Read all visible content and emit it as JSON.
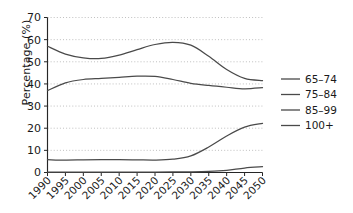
{
  "chart_data": {
    "type": "line",
    "title": "",
    "xlabel": "",
    "ylabel": "Percentage (%)",
    "xlim": [
      1990,
      2050
    ],
    "ylim": [
      0,
      70
    ],
    "yticks": [
      0,
      10,
      20,
      30,
      40,
      50,
      60,
      70
    ],
    "ytick_labels": [
      "0",
      "10",
      "20",
      "30",
      "40",
      "50",
      "60",
      "70"
    ],
    "xticks": [
      1990,
      1995,
      2000,
      2005,
      2010,
      2015,
      2020,
      2025,
      2030,
      2035,
      2040,
      2045,
      2050
    ],
    "xtick_labels": [
      "1990",
      "1995",
      "2000",
      "2005",
      "2010",
      "2015",
      "2020",
      "2025",
      "2030",
      "2035",
      "2040",
      "2045",
      "2050"
    ],
    "grid": true,
    "grid_axis": "y",
    "grid_style": "dotted",
    "legend_position": "right",
    "line_color": "#4a4a4a",
    "x": [
      1990,
      1995,
      2000,
      2005,
      2010,
      2015,
      2020,
      2025,
      2030,
      2035,
      2040,
      2045,
      2050
    ],
    "series": [
      {
        "name": "65-74",
        "label": "65–74",
        "values": [
          57.0,
          53.5,
          51.8,
          51.5,
          53.0,
          55.5,
          57.8,
          58.8,
          57.5,
          52.5,
          46.5,
          42.5,
          41.5
        ]
      },
      {
        "name": "75-84",
        "label": "75–84",
        "values": [
          37.0,
          40.5,
          42.0,
          42.5,
          43.0,
          43.5,
          43.4,
          42.0,
          40.3,
          39.3,
          38.5,
          37.8,
          38.3
        ]
      },
      {
        "name": "85-99",
        "label": "85–99",
        "values": [
          5.8,
          5.6,
          5.7,
          5.8,
          5.8,
          5.7,
          5.6,
          6.0,
          7.5,
          11.5,
          16.5,
          20.5,
          22.2
        ]
      },
      {
        "name": "100+",
        "label": "100+",
        "values": [
          0.15,
          0.15,
          0.18,
          0.2,
          0.2,
          0.2,
          0.22,
          0.25,
          0.3,
          0.5,
          1.0,
          2.0,
          2.6
        ]
      }
    ]
  },
  "legend": {
    "entries": [
      {
        "label": "65–74"
      },
      {
        "label": "75–84"
      },
      {
        "label": "85–99"
      },
      {
        "label": "100+"
      }
    ]
  }
}
